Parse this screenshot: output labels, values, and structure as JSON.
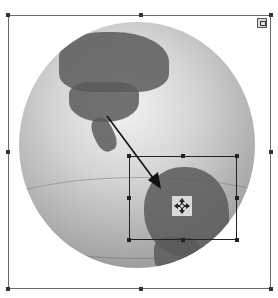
{
  "canvas": {
    "description": "Selected globe image with an inner crop/selection rectangle and direction arrow",
    "frame": {
      "left": 8,
      "top": 15,
      "right": 271,
      "bottom": 289
    },
    "selection": {
      "left": 129,
      "top": 156,
      "right": 237,
      "bottom": 240
    },
    "arrow": {
      "from": [
        107,
        116
      ],
      "to": [
        161,
        189
      ]
    },
    "icons": {
      "move": "move-cross-icon",
      "corner": "image-options-icon"
    },
    "colors": {
      "frame": "#6a6a6a",
      "handles": "#333333",
      "selection": "#222222",
      "globe_light": "#f2f2f2",
      "globe_dark": "#7a7a7a",
      "land": "#5b5b5b"
    }
  }
}
